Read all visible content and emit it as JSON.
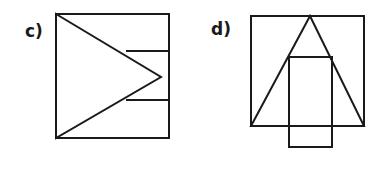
{
  "canvas": {
    "width": 388,
    "height": 185,
    "background_color": "#ffffff",
    "stroke_color": "#1a1a1a",
    "stroke_width": 2
  },
  "figures": [
    {
      "label": "c)",
      "label_position": {
        "x": 25,
        "y": 23
      },
      "description": "Square containing a left-pointing-base triangle with apex to the right, plus two short horizontal lines on the right side",
      "shapes": [
        {
          "name": "outer-square",
          "type": "rect",
          "points": "56,14 169,14 169,138 56,138",
          "closed": true
        },
        {
          "name": "inner-triangle",
          "type": "polygon",
          "points": "56,14 161,77 56,138",
          "closed": true
        },
        {
          "name": "upper-horizontal-line",
          "type": "line",
          "points": "126,51 169,51",
          "closed": false
        },
        {
          "name": "lower-horizontal-line",
          "type": "line",
          "points": "126,100 169,100",
          "closed": false
        }
      ]
    },
    {
      "label": "d)",
      "label_position": {
        "x": 211,
        "y": 21
      },
      "description": "Square with an inscribed upward triangle whose apex touches the top edge, plus a vertical rectangle straddling the bottom edge",
      "shapes": [
        {
          "name": "outer-square",
          "type": "rect",
          "points": "251,16 364,16 364,126 251,126",
          "closed": true
        },
        {
          "name": "inner-triangle",
          "type": "polygon",
          "points": "310,16 364,126 251,126",
          "closed": true
        },
        {
          "name": "overlapping-rectangle",
          "type": "rect",
          "points": "289,57 332,57 332,147 289,147",
          "closed": true
        }
      ]
    }
  ],
  "chart_data": {
    "type": "table",
    "xlabel": "",
    "ylabel": "",
    "categories": [
      "c)",
      "d)"
    ],
    "series": [
      {
        "name": "shape count per figure",
        "values": [
          4,
          3
        ]
      }
    ],
    "annotations": [
      "c): square 113x124 px with inscribed triangle apex pointing right and two horizontal segments",
      "d): square 113x110 px with inscribed triangle apex at top center and a vertical rectangle crossing the bottom edge"
    ]
  }
}
